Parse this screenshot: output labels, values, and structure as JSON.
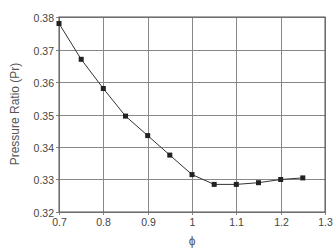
{
  "chart_data": {
    "type": "line",
    "title": "",
    "xlabel": "ϕ",
    "ylabel": "Pressure Ratio (Pr)",
    "xlim": [
      0.7,
      1.3
    ],
    "ylim": [
      0.32,
      0.38
    ],
    "xticks": [
      "0.7",
      "0.8",
      "0.9",
      "1",
      "1.1",
      "1.2",
      "1.3"
    ],
    "yticks": [
      "0.38",
      "0.37",
      "0.36",
      "0.35",
      "0.34",
      "0.33",
      "0.32"
    ],
    "grid": true,
    "legend": null,
    "series": [
      {
        "name": "Pressure Ratio",
        "marker": "square",
        "x": [
          0.7,
          0.75,
          0.8,
          0.85,
          0.9,
          0.95,
          1.0,
          1.05,
          1.1,
          1.15,
          1.2,
          1.25
        ],
        "y": [
          0.378,
          0.367,
          0.358,
          0.3495,
          0.3435,
          0.3375,
          0.3315,
          0.3285,
          0.3285,
          0.329,
          0.33,
          0.3305
        ]
      }
    ],
    "colors": {
      "line": "#333333",
      "marker": "#222222",
      "grid": "#888888"
    }
  }
}
